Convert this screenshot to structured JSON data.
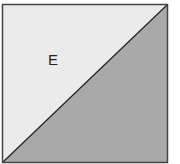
{
  "diagram": {
    "shape": "square-divided-by-diagonal",
    "regions": [
      {
        "id": "upper-left-triangle",
        "label": "E",
        "fill": "#ebebeb"
      },
      {
        "id": "lower-right-triangle",
        "label": "",
        "fill": "#a9a9a9"
      }
    ],
    "border_color": "#444444",
    "diagonal_color": "#222222"
  }
}
